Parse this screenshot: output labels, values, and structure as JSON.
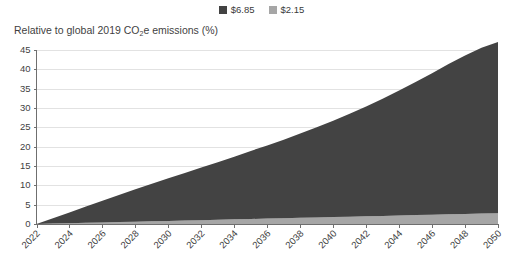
{
  "chart_data": {
    "type": "area",
    "title": "Relative to global 2019 CO2e emissions (%)",
    "title_prefix": "Relative to global 2019 CO",
    "title_sub": "2",
    "title_suffix": "e emissions (%)",
    "xlabel": "",
    "ylabel": "Relative to global 2019 CO2e emissions (%)",
    "stacked": true,
    "grid": true,
    "legend_position": "top-center",
    "ylim": [
      0,
      45
    ],
    "yticks": [
      0,
      5,
      10,
      15,
      20,
      25,
      30,
      35,
      40,
      45
    ],
    "xlim": [
      2022,
      2050
    ],
    "xticks": [
      2022,
      2024,
      2026,
      2028,
      2030,
      2032,
      2034,
      2036,
      2038,
      2040,
      2042,
      2044,
      2046,
      2048,
      2050
    ],
    "xtick_rotation": 45,
    "x": [
      2022,
      2023,
      2024,
      2025,
      2026,
      2027,
      2028,
      2029,
      2030,
      2031,
      2032,
      2033,
      2034,
      2035,
      2036,
      2037,
      2038,
      2039,
      2040,
      2041,
      2042,
      2043,
      2044,
      2045,
      2046,
      2047,
      2048,
      2049,
      2050
    ],
    "series": [
      {
        "name": "$2.15",
        "color": "#a6a6a6",
        "values": [
          0.0,
          0.1,
          0.2,
          0.3,
          0.4,
          0.5,
          0.6,
          0.7,
          0.8,
          0.9,
          1.0,
          1.1,
          1.2,
          1.3,
          1.4,
          1.5,
          1.6,
          1.7,
          1.8,
          1.9,
          2.0,
          2.1,
          2.2,
          2.3,
          2.4,
          2.5,
          2.6,
          2.7,
          2.8
        ]
      },
      {
        "name": "$6.85",
        "color": "#434343",
        "values": [
          0.0,
          1.4,
          2.8,
          4.2,
          5.6,
          7.0,
          8.4,
          9.7,
          11.0,
          12.3,
          13.6,
          14.9,
          16.2,
          17.6,
          18.9,
          20.3,
          21.8,
          23.3,
          24.9,
          26.6,
          28.4,
          30.3,
          32.3,
          34.4,
          36.6,
          38.9,
          41.0,
          42.9,
          44.3
        ]
      }
    ],
    "legend": [
      {
        "label": "$6.85",
        "color": "#434343"
      },
      {
        "label": "$2.15",
        "color": "#a6a6a6"
      }
    ],
    "colors": {
      "dark_series": "#434343",
      "light_series": "#a6a6a6",
      "grid": "#e2e2e2",
      "axis": "#6f6f6f",
      "text": "#3f3f3f",
      "background": "#ffffff"
    }
  }
}
